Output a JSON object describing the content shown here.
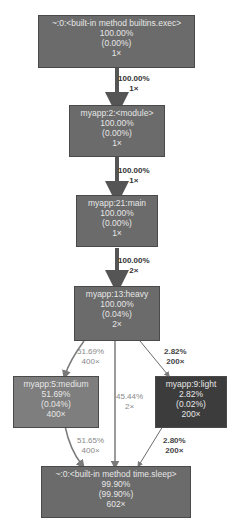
{
  "nodes": [
    {
      "id": "exec",
      "name": "~:0:<built-in method builtins.exec>",
      "total": "100.00%",
      "self": "(0.00%)",
      "calls": "1×",
      "color": "#6b6b6b"
    },
    {
      "id": "module",
      "name": "myapp:2:<module>",
      "total": "100.00%",
      "self": "(0.00%)",
      "calls": "1×",
      "color": "#6b6b6b"
    },
    {
      "id": "main",
      "name": "myapp:21:main",
      "total": "100.00%",
      "self": "(0.00%)",
      "calls": "1×",
      "color": "#6b6b6b"
    },
    {
      "id": "heavy",
      "name": "myapp:13:heavy",
      "total": "100.00%",
      "self": "(0.04%)",
      "calls": "2×",
      "color": "#6b6b6b"
    },
    {
      "id": "medium",
      "name": "myapp:5:medium",
      "total": "51.69%",
      "self": "(0.04%)",
      "calls": "400×",
      "color": "#7e7e7e"
    },
    {
      "id": "light",
      "name": "myapp:9:light",
      "total": "2.82%",
      "self": "(0.02%)",
      "calls": "200×",
      "color": "#3c3c3c"
    },
    {
      "id": "sleep",
      "name": "~:0:<built-in method time.sleep>",
      "total": "99.90%",
      "self": "(99.90%)",
      "calls": "602×",
      "color": "#6b6b6b"
    }
  ],
  "edges": [
    {
      "from": "exec",
      "to": "module",
      "percent": "100.00%",
      "calls": "1×",
      "color": "#555555",
      "label_color": "#333333"
    },
    {
      "from": "module",
      "to": "main",
      "percent": "100.00%",
      "calls": "1×",
      "color": "#555555",
      "label_color": "#333333"
    },
    {
      "from": "main",
      "to": "heavy",
      "percent": "100.00%",
      "calls": "2×",
      "color": "#555555",
      "label_color": "#333333"
    },
    {
      "from": "heavy",
      "to": "medium",
      "percent": "51.69%",
      "calls": "400×",
      "color": "#7a7a7a",
      "label_color": "#888888"
    },
    {
      "from": "heavy",
      "to": "sleep",
      "percent": "45.44%",
      "calls": "2×",
      "color": "#7a7a7a",
      "label_color": "#888888"
    },
    {
      "from": "heavy",
      "to": "light",
      "percent": "2.82%",
      "calls": "200×",
      "color": "#6a6a6a",
      "label_color": "#444444"
    },
    {
      "from": "medium",
      "to": "sleep",
      "percent": "51.65%",
      "calls": "400×",
      "color": "#7a7a7a",
      "label_color": "#888888"
    },
    {
      "from": "light",
      "to": "sleep",
      "percent": "2.80%",
      "calls": "200×",
      "color": "#6a6a6a",
      "label_color": "#444444"
    }
  ]
}
